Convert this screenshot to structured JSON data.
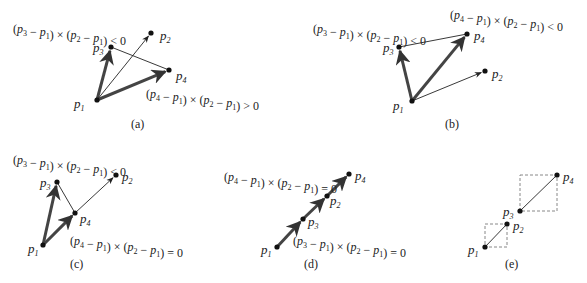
{
  "panels": [
    {
      "id": "a",
      "caption": "(a)",
      "caption_pos": [
        131,
        128
      ],
      "points": {
        "p1": [
          97,
          100
        ],
        "p2": [
          151,
          33
        ],
        "p3": [
          111,
          47
        ],
        "p4": [
          169,
          70
        ]
      },
      "labels": {
        "p1": [
          74,
          108
        ],
        "p2": [
          160,
          40
        ],
        "p3": [
          93,
          52
        ],
        "p4": [
          176,
          80
        ]
      },
      "segments": [
        {
          "from": "p1",
          "to": "p3",
          "style": "thick-arrow"
        },
        {
          "from": "p1",
          "to": "p4",
          "style": "thick-arrow"
        },
        {
          "from": "p1",
          "to": "p2",
          "style": "thin-arrow"
        },
        {
          "from": "p3",
          "to": "p4",
          "style": "thin"
        }
      ],
      "equations": [
        {
          "text": "(p3 − p1) × (p2 − p1) < 0",
          "pos": [
            13,
            33
          ]
        },
        {
          "text": "(p4 − p1) × (p2 − p1) > 0",
          "pos": [
            146,
            98
          ]
        }
      ]
    },
    {
      "id": "b",
      "caption": "(b)",
      "caption_pos": [
        445,
        128
      ],
      "points": {
        "p1": [
          412,
          101
        ],
        "p2": [
          485,
          71
        ],
        "p3": [
          399,
          47
        ],
        "p4": [
          467,
          34
        ]
      },
      "labels": {
        "p1": [
          393,
          110
        ],
        "p2": [
          492,
          78
        ],
        "p3": [
          383,
          52
        ],
        "p4": [
          474,
          40
        ]
      },
      "segments": [
        {
          "from": "p1",
          "to": "p3",
          "style": "thick-arrow"
        },
        {
          "from": "p1",
          "to": "p4",
          "style": "thick-arrow"
        },
        {
          "from": "p1",
          "to": "p2",
          "style": "thin-arrow"
        },
        {
          "from": "p3",
          "to": "p4",
          "style": "thin"
        }
      ],
      "equations": [
        {
          "text": "(p3 − p1) × (p2 − p1) < 0",
          "pos": [
            313,
            33
          ]
        },
        {
          "text": "(p4 − p1) × (p2 − p1) < 0",
          "pos": [
            450,
            19
          ]
        }
      ]
    },
    {
      "id": "c",
      "caption": "(c)",
      "caption_pos": [
        70,
        268
      ],
      "points": {
        "p1": [
          43,
          245
        ],
        "p2": [
          116,
          175
        ],
        "p3": [
          57,
          182
        ],
        "p4": [
          75,
          213
        ]
      },
      "labels": {
        "p1": [
          28,
          253
        ],
        "p2": [
          122,
          181
        ],
        "p3": [
          40,
          187
        ],
        "p4": [
          80,
          223
        ]
      },
      "segments": [
        {
          "from": "p1",
          "to": "p3",
          "style": "thick-arrow"
        },
        {
          "from": "p1",
          "to": "p4",
          "style": "thick-arrow"
        },
        {
          "from": "p4",
          "to": "p2",
          "style": "thin-arrow"
        },
        {
          "from": "p3",
          "to": "p4",
          "style": "thin"
        }
      ],
      "equations": [
        {
          "text": "(p3 − p1) × (p2 − p1) < 0",
          "pos": [
            13,
            164
          ]
        },
        {
          "text": "(p4 − p1) × (p2 − p1) = 0",
          "pos": [
            70,
            245
          ]
        }
      ]
    },
    {
      "id": "d",
      "caption": "(d)",
      "caption_pos": [
        304,
        268
      ],
      "points": {
        "p1": [
          277,
          247
        ],
        "p2": [
          327,
          196
        ],
        "p3": [
          303,
          219
        ],
        "p4": [
          349,
          174
        ]
      },
      "labels": {
        "p1": [
          261,
          254
        ],
        "p2": [
          330,
          205
        ],
        "p3": [
          308,
          226
        ],
        "p4": [
          355,
          180
        ]
      },
      "segments": [
        {
          "from": "p1",
          "to": "p3",
          "style": "thick-arrow"
        },
        {
          "from": "p3",
          "to": "p2",
          "style": "thick-arrow"
        },
        {
          "from": "p2",
          "to": "p4",
          "style": "thick-arrow"
        }
      ],
      "equations": [
        {
          "text": "(p4 − p1) × (p2 − p1) = 0",
          "pos": [
            224,
            181
          ]
        },
        {
          "text": "(p3 − p1) × (p2 − p1) = 0",
          "pos": [
            293,
            245
          ]
        }
      ]
    },
    {
      "id": "e",
      "caption": "(e)",
      "caption_pos": [
        505,
        268
      ],
      "points": {
        "p1": [
          485,
          247
        ],
        "p2": [
          507,
          224
        ],
        "p3": [
          520,
          211
        ],
        "p4": [
          557,
          175
        ]
      },
      "labels": {
        "p1": [
          468,
          254
        ],
        "p2": [
          513,
          230
        ],
        "p3": [
          503,
          216
        ],
        "p4": [
          563,
          181
        ]
      },
      "segments": [
        {
          "from": "p1",
          "to": "p2",
          "style": "thin"
        },
        {
          "from": "p3",
          "to": "p4",
          "style": "thin"
        }
      ],
      "boxes": [
        {
          "x": 485,
          "y": 224,
          "w": 22,
          "h": 23
        },
        {
          "x": 520,
          "y": 175,
          "w": 37,
          "h": 36
        }
      ],
      "equations": []
    }
  ],
  "colors": {
    "ink": "#222222",
    "thick": "#444444",
    "dash": "#888888"
  }
}
